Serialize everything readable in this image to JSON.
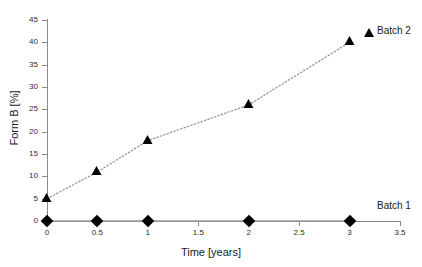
{
  "chart_data": {
    "type": "line",
    "title": "",
    "xlabel": "Time [years]",
    "ylabel": "Form B [%]",
    "xlim": [
      0,
      3.5
    ],
    "ylim": [
      0,
      45
    ],
    "xticks": [
      "0",
      "0.5",
      "1",
      "1.5",
      "2",
      "2.5",
      "3",
      "3.5"
    ],
    "yticks": [
      "0",
      "5",
      "10",
      "15",
      "20",
      "25",
      "30",
      "35",
      "40",
      "45"
    ],
    "grid": false,
    "legend_position": "inline-right",
    "series": [
      {
        "name": "Batch 1",
        "marker": "diamond",
        "linestyle": "solid",
        "color": "#000000",
        "x": [
          0,
          0.5,
          1,
          2,
          3
        ],
        "values": [
          0,
          0,
          0,
          0,
          0
        ]
      },
      {
        "name": "Batch 2",
        "marker": "triangle",
        "linestyle": "dotted",
        "color": "#000000",
        "x": [
          0,
          0.5,
          1,
          2,
          3
        ],
        "values": [
          5,
          11,
          18,
          26,
          40
        ]
      }
    ]
  },
  "legend": {
    "batch2_label": "Batch 2",
    "batch1_label": "Batch 1"
  },
  "colors": {
    "axis": "#8a8a8a",
    "marker": "#000000",
    "line": "#8a8a8a",
    "background": "#ffffff"
  }
}
